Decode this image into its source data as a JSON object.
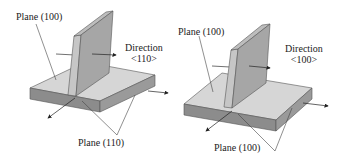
{
  "left_figure": {
    "plane_top_label": "Plane (100)",
    "direction_label": "Direction",
    "direction_value": "<110>",
    "plane_bottom_label": "Plane (110)"
  },
  "right_figure": {
    "plane_top_label": "Plane (100)",
    "direction_label": "Direction",
    "direction_value": "<100>",
    "plane_bottom_label": "Plane (100)"
  },
  "colors": {
    "top_face": "#d4d4d4",
    "side_face": "#8a8a8a",
    "fin_face": "#a8a8a8",
    "fin_edge": "#c8c8c8",
    "lines": "#444444"
  }
}
